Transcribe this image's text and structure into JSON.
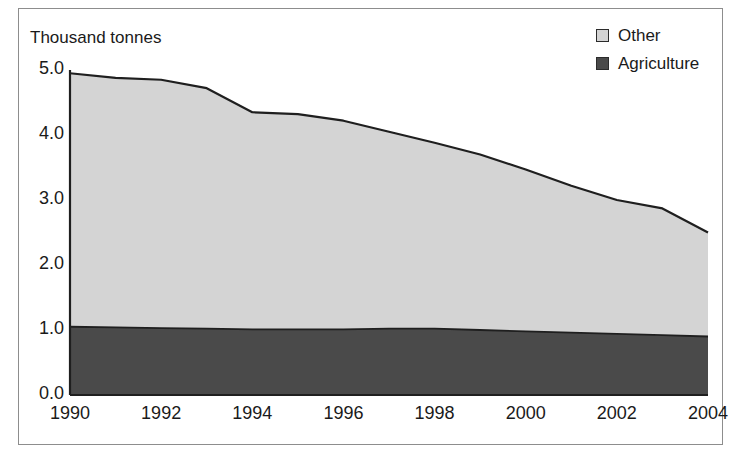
{
  "chart_data": {
    "type": "area",
    "stacked": true,
    "title": "",
    "subtitle": "",
    "ylabel": "Thousand tonnes",
    "xlabel": "",
    "x": [
      1990,
      1991,
      1992,
      1993,
      1994,
      1995,
      1996,
      1997,
      1998,
      1999,
      2000,
      2001,
      2002,
      2003,
      2004
    ],
    "xtick_labels": [
      "1990",
      "1992",
      "1994",
      "1996",
      "1998",
      "2000",
      "2002",
      "2004"
    ],
    "xtick_values": [
      1990,
      1992,
      1994,
      1996,
      1998,
      2000,
      2002,
      2004
    ],
    "ytick_labels": [
      "0.0",
      "1.0",
      "2.0",
      "3.0",
      "4.0",
      "5.0"
    ],
    "ytick_values": [
      0.0,
      1.0,
      2.0,
      3.0,
      4.0,
      5.0
    ],
    "ylim": [
      0.0,
      5.0
    ],
    "xlim": [
      1990,
      2004
    ],
    "grid": false,
    "legend_position": "top-right",
    "series": [
      {
        "name": "Agriculture",
        "color": "#4a4a4a",
        "values": [
          1.05,
          1.04,
          1.03,
          1.02,
          1.01,
          1.01,
          1.01,
          1.02,
          1.02,
          1.0,
          0.98,
          0.96,
          0.94,
          0.92,
          0.9
        ]
      },
      {
        "name": "Other",
        "color": "#d4d4d4",
        "values": [
          3.9,
          3.84,
          3.82,
          3.7,
          3.34,
          3.31,
          3.21,
          3.03,
          2.86,
          2.7,
          2.49,
          2.26,
          2.06,
          1.95,
          1.6
        ]
      }
    ],
    "totals": [
      4.95,
      4.88,
      4.85,
      4.72,
      4.35,
      4.32,
      4.22,
      4.05,
      3.88,
      3.7,
      3.47,
      3.22,
      3.0,
      2.87,
      2.5
    ]
  },
  "legend": {
    "items": [
      {
        "label": "Other",
        "color": "#d4d4d4"
      },
      {
        "label": "Agriculture",
        "color": "#4a4a4a"
      }
    ]
  },
  "colors": {
    "other": "#d4d4d4",
    "agriculture": "#4a4a4a",
    "line": "#1f1f1f",
    "frame": "#8d8d8d",
    "text": "#1a1a1a"
  }
}
